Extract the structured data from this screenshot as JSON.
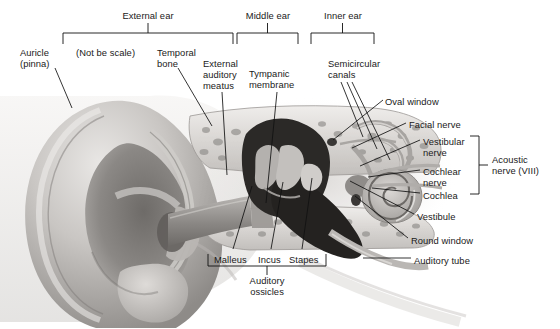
{
  "figure": {
    "background": "#ffffff",
    "ink": "#111111",
    "note": "(Not be scale)"
  },
  "region_brackets": [
    {
      "name": "external-ear",
      "label": "External ear",
      "x1": 63,
      "x2": 233,
      "y": 33,
      "label_x": 148,
      "label_y": 10
    },
    {
      "name": "middle-ear",
      "label": "Middle ear",
      "x1": 237,
      "x2": 298,
      "y": 33,
      "label_x": 268,
      "label_y": 10
    },
    {
      "name": "inner-ear",
      "label": "Inner ear",
      "x1": 311,
      "x2": 374,
      "y": 33,
      "label_x": 343,
      "label_y": 10
    }
  ],
  "ossicles_bracket": {
    "name": "auditory-ossicles",
    "label": "Auditory\nossicles",
    "x1": 208,
    "x2": 326,
    "y": 266,
    "label_x": 267,
    "label_y": 275
  },
  "acoustic_bracket": {
    "name": "acoustic-nerve",
    "label": "Acoustic\nnerve (VIII)",
    "x": 479,
    "y1": 136,
    "y2": 194,
    "label_x": 492,
    "label_y": 154
  },
  "labels": [
    {
      "name": "auricle-pinna",
      "text": "Auricle\n(pinna)",
      "x": 20,
      "y": 47,
      "align": "left"
    },
    {
      "name": "not-to-scale-note",
      "text": "(Not be scale)",
      "x": 76,
      "y": 47,
      "align": "left"
    },
    {
      "name": "temporal-bone",
      "text": "Temporal\nbone",
      "x": 157,
      "y": 47,
      "align": "left"
    },
    {
      "name": "external-auditory-meatus",
      "text": "External\nauditory\nmeatus",
      "x": 203,
      "y": 58,
      "align": "left"
    },
    {
      "name": "tympanic-membrane",
      "text": "Tympanic\nmembrane",
      "x": 249,
      "y": 68,
      "align": "left"
    },
    {
      "name": "semicircular-canals",
      "text": "Semicircular\ncanals",
      "x": 328,
      "y": 58,
      "align": "left"
    },
    {
      "name": "oval-window",
      "text": "Oval window",
      "x": 385,
      "y": 96,
      "align": "left"
    },
    {
      "name": "facial-nerve",
      "text": "Facial nerve",
      "x": 409,
      "y": 119,
      "align": "left"
    },
    {
      "name": "vestibular-nerve",
      "text": "Vestibular\nnerve",
      "x": 423,
      "y": 136,
      "align": "left"
    },
    {
      "name": "cochlear-nerve",
      "text": "Cochlear\nnerve",
      "x": 423,
      "y": 166,
      "align": "left"
    },
    {
      "name": "cochlea",
      "text": "Cochlea",
      "x": 423,
      "y": 190,
      "align": "left"
    },
    {
      "name": "vestibule",
      "text": "Vestibule",
      "x": 417,
      "y": 211,
      "align": "left"
    },
    {
      "name": "round-window",
      "text": "Round window",
      "x": 411,
      "y": 235,
      "align": "left"
    },
    {
      "name": "auditory-tube",
      "text": "Auditory tube",
      "x": 414,
      "y": 255,
      "align": "left"
    },
    {
      "name": "malleus",
      "text": "Malleus",
      "x": 214,
      "y": 254,
      "align": "left"
    },
    {
      "name": "incus",
      "text": "Incus",
      "x": 258,
      "y": 254,
      "align": "left"
    },
    {
      "name": "stapes",
      "text": "Stapes",
      "x": 289,
      "y": 254,
      "align": "left"
    }
  ],
  "leader_lines": [
    {
      "name": "leader-auricle",
      "pts": "55,68 72,108"
    },
    {
      "name": "leader-temporal-bone",
      "pts": "178,68 212,126"
    },
    {
      "name": "leader-meatus",
      "pts": "222,92 227,175"
    },
    {
      "name": "leader-tympanic-membrane",
      "pts": "277,92 266,203"
    },
    {
      "name": "leader-semicircular-1",
      "pts": "341,82 363,137"
    },
    {
      "name": "leader-semicircular-2",
      "pts": "347,82 377,149"
    },
    {
      "name": "leader-semicircular-3",
      "pts": "352,82 390,160"
    },
    {
      "name": "leader-oval-window",
      "pts": "383,100 333,140"
    },
    {
      "name": "leader-facial-nerve",
      "pts": "406,123 352,148"
    },
    {
      "name": "leader-vestibular-nerve",
      "pts": "420,140 360,166"
    },
    {
      "name": "leader-cochlear-nerve",
      "pts": "420,170 368,177"
    },
    {
      "name": "leader-cochlea",
      "pts": "420,193 372,188"
    },
    {
      "name": "leader-vestibule",
      "pts": "414,214 350,181"
    },
    {
      "name": "leader-round-window",
      "pts": "408,238 355,196"
    },
    {
      "name": "leader-auditory-tube",
      "pts": "411,258 363,258"
    },
    {
      "name": "leader-malleus",
      "pts": "233,249 252,186"
    },
    {
      "name": "leader-incus",
      "pts": "271,249 283,182"
    },
    {
      "name": "leader-stapes",
      "pts": "302,249 312,178"
    }
  ]
}
